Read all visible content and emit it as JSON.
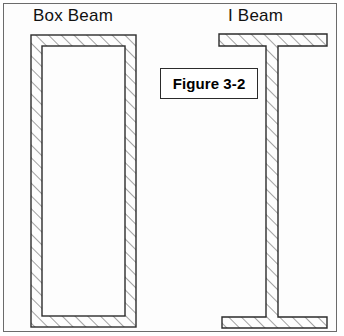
{
  "figure": {
    "plate_background": "#fdfdfd",
    "frame_color": "#6b6b6b",
    "line_color": "#2b2b2b",
    "hatch_color": "#555555",
    "fill_color": "#ffffff"
  },
  "captions": {
    "box_beam": "Box Beam",
    "i_beam": "I Beam"
  },
  "label_box": {
    "text": "Figure 3-2"
  },
  "diagram_data": {
    "type": "engineering-cross-section",
    "description": "Two structural steel beam cross sections shown side by side, both section-hatched at 45 degrees",
    "shapes": [
      {
        "name": "box-beam",
        "kind": "hollow-rectangular-section",
        "outer": {
          "x": 31,
          "y": 35,
          "width": 105,
          "height": 292
        },
        "inner": {
          "x": 42,
          "y": 46,
          "width": 83,
          "height": 270
        },
        "wall_thickness": 11
      },
      {
        "name": "i-beam",
        "kind": "wide-flange-section",
        "top_flange": {
          "x": 219,
          "y": 34,
          "width": 108,
          "height": 12
        },
        "bottom_flange": {
          "x": 222,
          "y": 317,
          "width": 105,
          "height": 11
        },
        "web": {
          "x": 266,
          "y": 46,
          "width": 12,
          "height": 271
        }
      }
    ],
    "hatch": {
      "angle_degrees": 45,
      "direction": "lower-left to upper-right",
      "spacing_px": 9
    }
  }
}
